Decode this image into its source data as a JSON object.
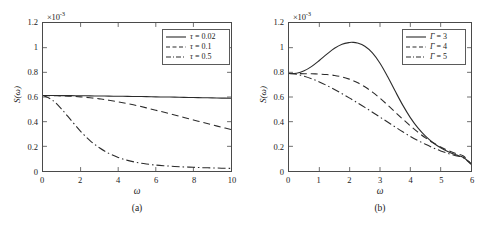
{
  "figure": {
    "panels": [
      {
        "id": "a",
        "caption": "(a)",
        "multiplier_base": "×10",
        "multiplier_exp": "-3",
        "xlabel": "ω",
        "ylabel": "S(ω)",
        "xticks": [
          "0",
          "2",
          "4",
          "6",
          "8",
          "10"
        ],
        "yticks": [
          "0",
          "0.2",
          "0.4",
          "0.6",
          "0.8",
          "1",
          "1.2"
        ],
        "legend": [
          {
            "symbol": "τ",
            "eq": " = ",
            "value": "0.02",
            "style": "solid"
          },
          {
            "symbol": "τ",
            "eq": " = ",
            "value": "0.1",
            "style": "dashed"
          },
          {
            "symbol": "τ",
            "eq": " = ",
            "value": "0.5",
            "style": "dashdot"
          }
        ]
      },
      {
        "id": "b",
        "caption": "(b)",
        "multiplier_base": "×10",
        "multiplier_exp": "-3",
        "xlabel": "ω",
        "ylabel": "S(ω)",
        "xticks": [
          "0",
          "1",
          "2",
          "3",
          "4",
          "5",
          "6"
        ],
        "yticks": [
          "0",
          "0.2",
          "0.4",
          "0.6",
          "0.8",
          "1",
          "1.2"
        ],
        "legend": [
          {
            "symbol": "Γ",
            "eq": " = ",
            "value": "3",
            "style": "solid"
          },
          {
            "symbol": "Γ",
            "eq": " = ",
            "value": "4",
            "style": "dashed"
          },
          {
            "symbol": "Γ",
            "eq": " = ",
            "value": "5",
            "style": "dashdot"
          }
        ]
      }
    ]
  },
  "chart_data": [
    {
      "type": "line",
      "panel": "a",
      "title": "",
      "xlabel": "ω",
      "ylabel": "S(ω)",
      "xlim": [
        0,
        10
      ],
      "ylim": [
        0,
        1.2
      ],
      "y_multiplier": 0.001,
      "xticks": [
        0,
        2,
        4,
        6,
        8,
        10
      ],
      "yticks": [
        0,
        0.2,
        0.4,
        0.6,
        0.8,
        1,
        1.2
      ],
      "grid": false,
      "legend_position": "upper right",
      "x": [
        0,
        0.5,
        1,
        1.5,
        2,
        2.5,
        3,
        3.5,
        4,
        4.5,
        5,
        5.5,
        6,
        6.5,
        7,
        7.5,
        8,
        8.5,
        9,
        9.5,
        10
      ],
      "series": [
        {
          "name": "τ = 0.02",
          "style": "solid",
          "values": [
            0.612,
            0.612,
            0.611,
            0.611,
            0.61,
            0.609,
            0.608,
            0.607,
            0.606,
            0.605,
            0.604,
            0.603,
            0.601,
            0.6,
            0.599,
            0.597,
            0.596,
            0.594,
            0.593,
            0.591,
            0.59
          ]
        },
        {
          "name": "τ = 0.1",
          "style": "dashed",
          "values": [
            0.612,
            0.611,
            0.609,
            0.606,
            0.601,
            0.594,
            0.585,
            0.574,
            0.561,
            0.546,
            0.53,
            0.512,
            0.493,
            0.474,
            0.454,
            0.434,
            0.414,
            0.394,
            0.374,
            0.355,
            0.336
          ]
        },
        {
          "name": "τ = 0.5",
          "style": "dashdot",
          "values": [
            0.612,
            0.575,
            0.5,
            0.41,
            0.322,
            0.247,
            0.188,
            0.143,
            0.11,
            0.086,
            0.069,
            0.057,
            0.048,
            0.042,
            0.037,
            0.033,
            0.03,
            0.027,
            0.025,
            0.023,
            0.021
          ]
        }
      ]
    },
    {
      "type": "line",
      "panel": "b",
      "title": "",
      "xlabel": "ω",
      "ylabel": "S(ω)",
      "xlim": [
        0,
        6
      ],
      "ylim": [
        0,
        1.2
      ],
      "y_multiplier": 0.001,
      "xticks": [
        0,
        1,
        2,
        3,
        4,
        5,
        6
      ],
      "yticks": [
        0,
        0.2,
        0.4,
        0.6,
        0.8,
        1,
        1.2
      ],
      "grid": false,
      "legend_position": "upper right",
      "x": [
        0,
        0.25,
        0.5,
        0.75,
        1,
        1.25,
        1.5,
        1.75,
        2,
        2.1,
        2.25,
        2.5,
        2.75,
        3,
        3.25,
        3.5,
        3.75,
        4,
        4.25,
        4.5,
        4.75,
        5,
        5.25,
        5.5,
        5.75,
        6
      ],
      "series": [
        {
          "name": "Γ = 3",
          "style": "solid",
          "values": [
            0.79,
            0.793,
            0.812,
            0.848,
            0.896,
            0.948,
            0.995,
            1.028,
            1.042,
            1.043,
            1.038,
            1.012,
            0.958,
            0.874,
            0.766,
            0.648,
            0.534,
            0.433,
            0.349,
            0.282,
            0.229,
            0.188,
            0.156,
            0.131,
            0.11,
            0.06
          ]
        },
        {
          "name": "Γ = 4",
          "style": "dashed",
          "values": [
            0.79,
            0.79,
            0.789,
            0.788,
            0.786,
            0.782,
            0.775,
            0.763,
            0.744,
            0.734,
            0.718,
            0.683,
            0.64,
            0.59,
            0.535,
            0.478,
            0.421,
            0.366,
            0.315,
            0.269,
            0.229,
            0.195,
            0.166,
            0.142,
            0.122,
            0.058
          ]
        },
        {
          "name": "Γ = 5",
          "style": "dashdot",
          "values": [
            0.79,
            0.784,
            0.769,
            0.748,
            0.722,
            0.693,
            0.661,
            0.627,
            0.591,
            0.576,
            0.554,
            0.516,
            0.477,
            0.437,
            0.397,
            0.357,
            0.318,
            0.281,
            0.247,
            0.216,
            0.188,
            0.163,
            0.142,
            0.124,
            0.108,
            0.055
          ]
        }
      ]
    }
  ]
}
